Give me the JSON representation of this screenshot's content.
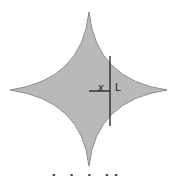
{
  "figure": {
    "shape": "astroid",
    "fill_color": "#b9b9b9",
    "stroke_color": "#8a8a8a",
    "line_color": "#222222",
    "labels": {
      "x": "x",
      "L": "L"
    },
    "caption": "▪ ▪ ▪ ▪▪"
  }
}
